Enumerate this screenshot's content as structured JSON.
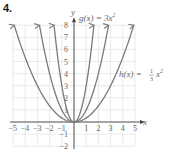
{
  "problem_number": "4.",
  "chart_data": {
    "type": "line",
    "title": "",
    "xlabel": "x",
    "ylabel": "y",
    "xlim": [
      -5,
      5
    ],
    "ylim": [
      -2,
      8
    ],
    "grid": true,
    "x_ticks": [
      -5,
      -4,
      -3,
      -2,
      -1,
      1,
      2,
      3,
      4,
      5
    ],
    "y_ticks": [
      -2,
      -1,
      1,
      2,
      3,
      4,
      5,
      6,
      7,
      8
    ],
    "series": [
      {
        "name": "g(x) = 3x^2",
        "coefficient": 3,
        "label": "g(x) = 3x²"
      },
      {
        "name": "f(x) = x^2",
        "coefficient": 1,
        "label": ""
      },
      {
        "name": "h(x) = (1/3)x^2",
        "coefficient": 0.3333,
        "label": "h(x) = ⅓x²"
      }
    ],
    "annotations": [
      {
        "text": "g(x) = 3x²",
        "near": [
          0.3,
          8
        ]
      },
      {
        "text": "h(x) = ⅓x²",
        "near": [
          4.7,
          4
        ]
      }
    ]
  },
  "labels": {
    "x_axis": "x",
    "y_axis": "y",
    "g_label": "g(x) = 3x",
    "g_exp": "2",
    "h_label_pre": "h(x) = ",
    "h_frac_num": "1",
    "h_frac_den": "3",
    "h_label_post": "x",
    "h_exp": "2"
  },
  "colors": {
    "curve": "#7a7a7a",
    "grid": "#dcdcdc",
    "axis": "#444444",
    "text": "#666666"
  }
}
